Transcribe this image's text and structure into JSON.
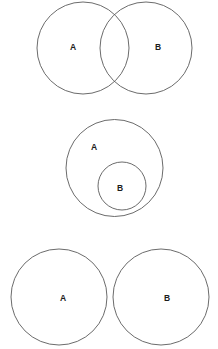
{
  "canvas": {
    "width": 218,
    "height": 349,
    "background": "#ffffff",
    "stroke_color": "#5a5a5a",
    "label_color": "#1c1c1c"
  },
  "figures": [
    {
      "id": "overlap",
      "relation": "intersecting",
      "description": "Two overlapping circles A and B sharing a lens-shaped intersection",
      "sets": [
        {
          "label": "A",
          "cx": 83,
          "cy": 48,
          "r": 46,
          "label_x": 73,
          "label_y": 47
        },
        {
          "label": "B",
          "cx": 146,
          "cy": 48,
          "r": 46,
          "label_x": 158,
          "label_y": 47
        }
      ]
    },
    {
      "id": "subset",
      "relation": "subset",
      "description": "Circle B fully contained inside circle A",
      "sets": [
        {
          "label": "A",
          "cx": 114.5,
          "cy": 168,
          "r": 48.5,
          "label_x": 94,
          "label_y": 147
        },
        {
          "label": "B",
          "cx": 122,
          "cy": 186,
          "r": 24,
          "label_x": 120,
          "label_y": 188
        }
      ]
    },
    {
      "id": "disjoint",
      "relation": "disjoint",
      "description": "Two separate non-overlapping circles A and B",
      "sets": [
        {
          "label": "A",
          "cx": 59,
          "cy": 297,
          "r": 48,
          "label_x": 63,
          "label_y": 298
        },
        {
          "label": "B",
          "cx": 161,
          "cy": 297,
          "r": 48,
          "label_x": 167,
          "label_y": 298
        }
      ]
    }
  ]
}
